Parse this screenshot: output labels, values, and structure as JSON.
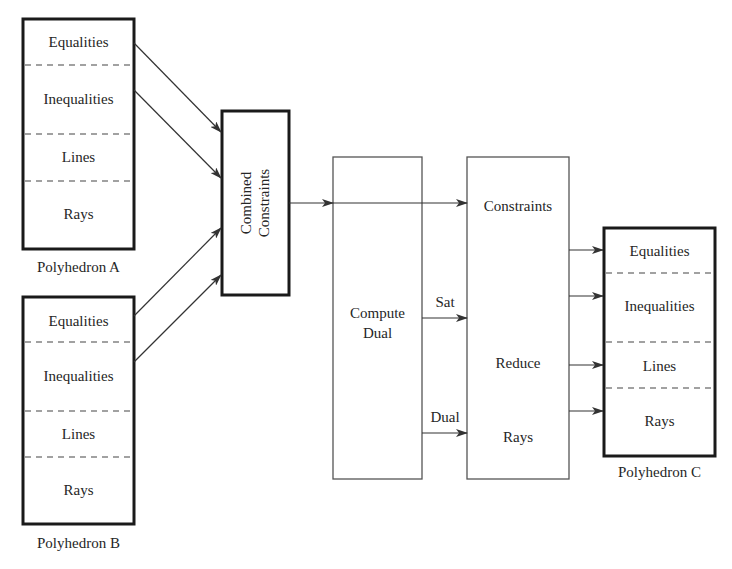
{
  "diagram": {
    "polyhedron_a": {
      "caption": "Polyhedron A",
      "sections": [
        "Equalities",
        "Inequalities",
        "Lines",
        "Rays"
      ]
    },
    "polyhedron_b": {
      "caption": "Polyhedron B",
      "sections": [
        "Equalities",
        "Inequalities",
        "Lines",
        "Rays"
      ]
    },
    "combined": {
      "line1": "Combined",
      "line2": "Constraints"
    },
    "compute_dual": {
      "line1": "Compute",
      "line2": "Dual"
    },
    "reduce_block": {
      "top": "Constraints",
      "middle": "Reduce",
      "bottom": "Rays"
    },
    "edge_labels": {
      "sat": "Sat",
      "dual": "Dual"
    },
    "polyhedron_c": {
      "caption": "Polyhedron C",
      "sections": [
        "Equalities",
        "Inequalities",
        "Lines",
        "Rays"
      ]
    },
    "colors": {
      "stroke": "#1a1a1a",
      "thin_stroke": "#555555",
      "background": "#ffffff"
    }
  }
}
